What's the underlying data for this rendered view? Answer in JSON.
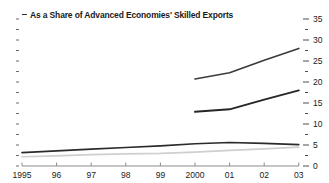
{
  "chart_data": {
    "type": "line",
    "title": "As a Share of Advanced Economies' Skilled Exports",
    "xlabel": "",
    "ylabel": "",
    "ylim": [
      0,
      35
    ],
    "yticks": [
      0,
      5,
      10,
      15,
      20,
      25,
      30,
      35
    ],
    "ytick_labels": [
      "0",
      "5",
      "10",
      "15",
      "20",
      "25",
      "30",
      "35"
    ],
    "yminor_step": 2.5,
    "grid": false,
    "legend": "none",
    "axis_side": "right",
    "x": [
      1995,
      1996,
      1997,
      1998,
      1999,
      2000,
      2001,
      2002,
      2003
    ],
    "xtick_labels": [
      "1995",
      "96",
      "97",
      "98",
      "99",
      "2000",
      "01",
      "02",
      "03"
    ],
    "series": [
      {
        "name": "series-upper",
        "color": "#3a3a3a",
        "width": 1.6,
        "x": [
          2000,
          2001,
          2002,
          2003
        ],
        "values": [
          20.7,
          22.2,
          25.2,
          28.0
        ]
      },
      {
        "name": "series-middle",
        "color": "#262626",
        "width": 1.9,
        "x": [
          2000,
          2001,
          2002,
          2003
        ],
        "values": [
          12.9,
          13.5,
          15.8,
          18.0
        ]
      },
      {
        "name": "series-lower-dark",
        "color": "#2b2b2b",
        "width": 1.7,
        "x": [
          1995,
          1996,
          1997,
          1998,
          1999,
          2000,
          2001,
          2002,
          2003
        ],
        "values": [
          3.2,
          3.6,
          4.0,
          4.4,
          4.8,
          5.3,
          5.6,
          5.4,
          5.1
        ]
      },
      {
        "name": "series-lower-light",
        "color": "#cfcfcf",
        "width": 1.7,
        "x": [
          1995,
          1996,
          1997,
          1998,
          1999,
          2000,
          2001,
          2002,
          2003
        ],
        "values": [
          2.2,
          2.4,
          2.7,
          2.9,
          3.0,
          3.3,
          3.7,
          4.1,
          4.5
        ]
      }
    ],
    "annotations": []
  },
  "axis": {
    "ytick_mark_color": "#4d4d4d",
    "xaxis_color": "#8c8c8c",
    "baseline_color": "#b3b3b3"
  }
}
